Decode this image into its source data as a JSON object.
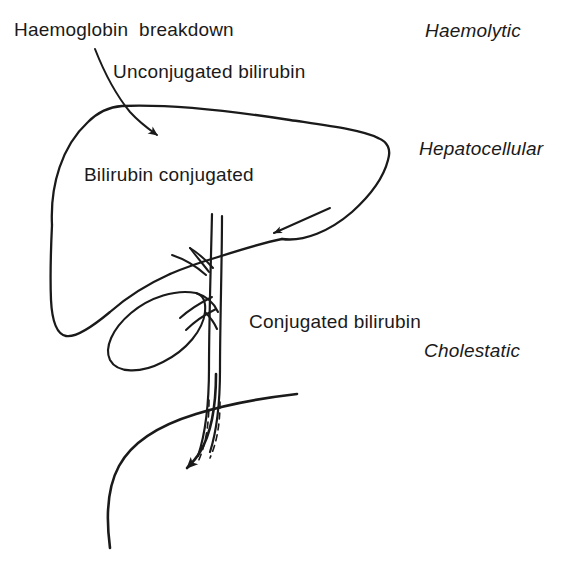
{
  "figure": {
    "kind": "anatomical-flow-diagram",
    "ink_color": "#1a1a1a",
    "background_color": "#ffffff"
  },
  "labels": {
    "haemoglobin_breakdown": "Haemoglobin  breakdown",
    "unconjugated_bilirubin": "Unconjugated bilirubin",
    "bilirubin_conjugated": "Bilirubin conjugated",
    "conjugated_bilirubin": "Conjugated bilirubin"
  },
  "jaundice_types": {
    "haemolytic": "Haemolytic",
    "hepatocellular": "Hepatocellular",
    "cholestatic": "Cholestatic"
  },
  "anatomy": {
    "liver": "liver-outline",
    "gallbladder": "gallbladder-outline",
    "hepatic_ducts": "hepatic-duct-branches",
    "cystic_duct": "cystic-duct",
    "common_bile_duct": "common-bile-duct",
    "duodenum": "duodenum-outline"
  },
  "arrows": {
    "haemoglobin_to_liver": "arrow-haemoglobin-into-liver",
    "uptake_into_liver": "arrow-uptake-into-liver",
    "bile_into_duodenum": "arrow-bile-into-duodenum"
  }
}
